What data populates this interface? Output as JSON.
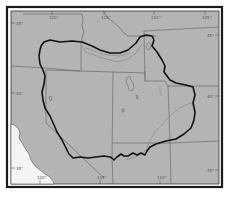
{
  "map": {
    "colors": {
      "page": "#ffffff",
      "land": "#b4b4b4",
      "ocean": "#f2f2f2",
      "frame_outer": "#1a1a1a",
      "frame_inner": "#333333",
      "state_lines": "#6a6a6a",
      "rivers": "#8a8a8a",
      "outline": "#111111"
    },
    "ticks": {
      "top": [
        {
          "label": "120°",
          "x": 52
        },
        {
          "label": "115°",
          "x": 104
        },
        {
          "label": "110°",
          "x": 154
        },
        {
          "label": "105°",
          "x": 205
        }
      ],
      "bottom": [
        {
          "label": "120°",
          "x": 40
        },
        {
          "label": "115°",
          "x": 100
        },
        {
          "label": "110°",
          "x": 160
        }
      ],
      "left": [
        {
          "label": "45°",
          "y": 23
        },
        {
          "label": "40°",
          "y": 93
        },
        {
          "label": "35°",
          "y": 168
        }
      ],
      "right": [
        {
          "label": "45°",
          "y": 35
        },
        {
          "label": "40°",
          "y": 96
        },
        {
          "label": "35°",
          "y": 170
        }
      ]
    },
    "features": {
      "region_outline": "Bold boundary enclosing the interior region",
      "lakes": [
        "Great Salt Lake",
        "Yellowstone Lake"
      ],
      "rivers": [
        "Snake River",
        "Colorado River"
      ]
    }
  }
}
